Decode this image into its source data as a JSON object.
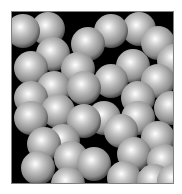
{
  "scene": {
    "description": "Rendered packing of gray shaded spheres in a square box",
    "box": {
      "x": 11,
      "y": 11,
      "width": 163,
      "height": 173,
      "background": "#000000",
      "border": "#808080"
    },
    "sphere_radius": 17,
    "sphere_colors": {
      "highlight": "#ffffff",
      "mid": "#b4b4b4",
      "shadow": "#505050"
    },
    "spheres": [
      [
        12,
        20
      ],
      [
        37,
        18
      ],
      [
        100,
        20
      ],
      [
        128,
        18
      ],
      [
        163,
        50
      ],
      [
        147,
        32
      ],
      [
        20,
        57
      ],
      [
        42,
        43
      ],
      [
        77,
        33
      ],
      [
        67,
        58
      ],
      [
        122,
        55
      ],
      [
        147,
        70
      ],
      [
        100,
        70
      ],
      [
        20,
        87
      ],
      [
        43,
        77
      ],
      [
        73,
        77
      ],
      [
        127,
        87
      ],
      [
        160,
        97
      ],
      [
        20,
        107
      ],
      [
        47,
        100
      ],
      [
        73,
        110
      ],
      [
        127,
        107
      ],
      [
        93,
        107
      ],
      [
        110,
        120
      ],
      [
        33,
        133
      ],
      [
        52,
        130
      ],
      [
        60,
        147
      ],
      [
        147,
        127
      ],
      [
        83,
        153
      ],
      [
        123,
        143
      ],
      [
        153,
        150
      ],
      [
        27,
        157
      ],
      [
        57,
        173
      ],
      [
        113,
        167
      ],
      [
        143,
        170
      ],
      [
        163,
        170
      ]
    ]
  }
}
